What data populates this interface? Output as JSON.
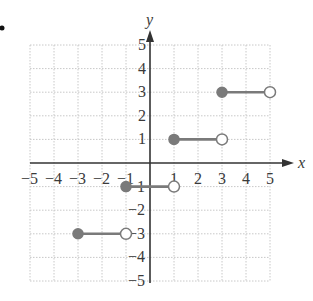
{
  "chart_data": {
    "type": "line",
    "title": "",
    "xlabel": "x",
    "ylabel": "y",
    "xlim": [
      -5,
      5
    ],
    "ylim": [
      -5,
      5
    ],
    "grid": true,
    "x_ticks": [
      "-5",
      "-4",
      "-3",
      "-2",
      "-1",
      "1",
      "2",
      "3",
      "4",
      "5"
    ],
    "y_ticks": [
      "5",
      "4",
      "3",
      "2",
      "1",
      "-1",
      "-2",
      "-3",
      "-4",
      "-5"
    ],
    "series": [
      {
        "name": "segment-1",
        "x_start": -3,
        "x_end": -1,
        "y": -3,
        "start_closed": true,
        "end_closed": false
      },
      {
        "name": "segment-2",
        "x_start": -1,
        "x_end": 1,
        "y": -1,
        "start_closed": true,
        "end_closed": false
      },
      {
        "name": "segment-3",
        "x_start": 1,
        "x_end": 3,
        "y": 1,
        "start_closed": true,
        "end_closed": false
      },
      {
        "name": "segment-4",
        "x_start": 3,
        "x_end": 5,
        "y": 3,
        "start_closed": true,
        "end_closed": false
      }
    ],
    "colors": {
      "segment": "#7a7a7a",
      "axis": "#333333",
      "grid": "#c8c8c8"
    }
  },
  "labels": {
    "x_axis": "x",
    "y_axis": "y",
    "bullet": "•"
  }
}
